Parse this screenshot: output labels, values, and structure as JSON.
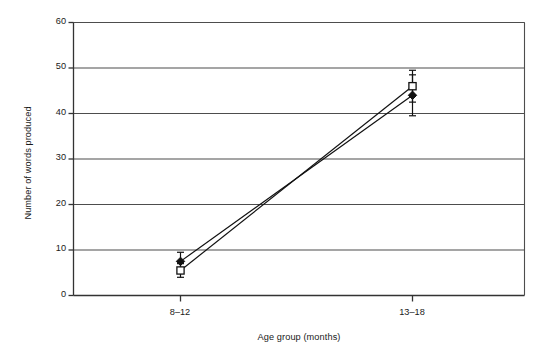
{
  "chart_data": {
    "type": "line",
    "title": "",
    "xlabel": "Age group (months)",
    "ylabel": "Number of words produced",
    "categories": [
      "8–12",
      "13–18"
    ],
    "x_tick_labels": [
      "8–12",
      "13–18"
    ],
    "y_tick_labels": [
      "0",
      "10",
      "20",
      "30",
      "40",
      "50",
      "60"
    ],
    "y_ticks": [
      0,
      10,
      20,
      30,
      40,
      50,
      60
    ],
    "ylim": [
      0,
      60
    ],
    "grid": "horizontal",
    "legend": "none",
    "series": [
      {
        "name": "filled-diamond",
        "marker": "filled-diamond",
        "values": [
          7.5,
          44.0
        ],
        "errors": [
          2.0,
          4.5
        ]
      },
      {
        "name": "open-square",
        "marker": "open-square",
        "values": [
          5.5,
          46.0
        ],
        "errors": [
          1.5,
          3.5
        ]
      }
    ],
    "colors": {
      "line": "#111111",
      "marker_fill": "#111111",
      "marker_open_fill": "#ffffff",
      "grid": "#4d4d4d",
      "axis": "#333333",
      "background": "#ffffff"
    }
  },
  "axes": {
    "y_title": "Number of words produced",
    "x_title": "Age group (months)",
    "y_labels": [
      "60",
      "50",
      "40",
      "30",
      "20",
      "10",
      "0"
    ],
    "x_labels": [
      "8–12",
      "13–18"
    ]
  }
}
